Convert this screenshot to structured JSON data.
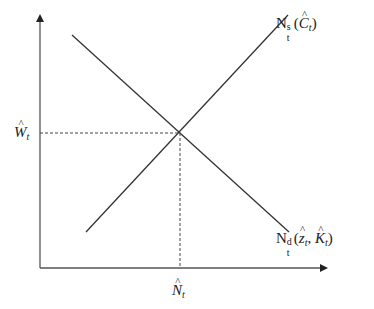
{
  "diagram": {
    "type": "supply-demand",
    "axes": {
      "y_label": "W",
      "y_label_sub": "t",
      "x_label": "N",
      "x_label_sub": "t"
    },
    "curves": {
      "supply": {
        "base": "N",
        "sup": "s",
        "sub": "t",
        "open": "(",
        "arg": "C",
        "arg_sub": "t",
        "close": ")"
      },
      "demand": {
        "base": "N",
        "sup": "d",
        "sub": "t",
        "open": "(",
        "arg1": "z",
        "arg1_sub": "t",
        "sep": ", ",
        "arg2": "K",
        "arg2_sub": "t",
        "close": ")"
      }
    },
    "hat": "^",
    "colors": {
      "line": "#333333",
      "axis": "#555555"
    }
  }
}
